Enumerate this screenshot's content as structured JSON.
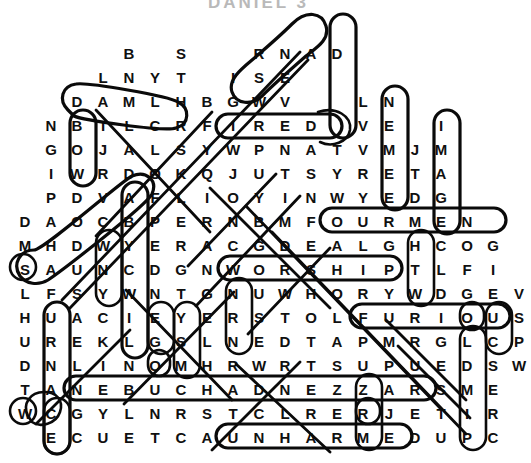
{
  "title": "DANIEL 3",
  "puzzle": {
    "kind": "word-search",
    "shape": "diamond",
    "cell_width": 26,
    "cell_height": 24,
    "origin_x": 12,
    "origin_y": 42,
    "rows": [
      {
        "index": 0,
        "start_col": 4,
        "letters": [
          "B",
          "",
          "S",
          "",
          "",
          "R",
          "N",
          "A",
          "D"
        ]
      },
      {
        "index": 1,
        "start_col": 3,
        "letters": [
          "L",
          "N",
          "Y",
          "T",
          "",
          "I",
          "S",
          "E"
        ]
      },
      {
        "index": 2,
        "start_col": 2,
        "letters": [
          "D",
          "A",
          "M",
          "L",
          "H",
          "B",
          "G",
          "W",
          "V",
          "",
          "",
          "L",
          "N"
        ]
      },
      {
        "index": 3,
        "start_col": 1,
        "letters": [
          "N",
          "B",
          "I",
          "L",
          "C",
          "R",
          "F",
          "I",
          "R",
          "E",
          "D",
          "",
          "V",
          "E",
          "",
          "I"
        ]
      },
      {
        "index": 4,
        "start_col": 1,
        "letters": [
          "G",
          "O",
          "J",
          "A",
          "L",
          "S",
          "Y",
          "W",
          "P",
          "N",
          "A",
          "T",
          "V",
          "M",
          "J",
          "M"
        ]
      },
      {
        "index": 5,
        "start_col": 1,
        "letters": [
          "I",
          "W",
          "R",
          "D",
          "O",
          "K",
          "Q",
          "J",
          "U",
          "T",
          "S",
          "Y",
          "R",
          "E",
          "T",
          "A"
        ]
      },
      {
        "index": 6,
        "start_col": 1,
        "letters": [
          "P",
          "D",
          "V",
          "A",
          "F",
          "L",
          "I",
          "O",
          "Y",
          "I",
          "N",
          "W",
          "Y",
          "E",
          "D",
          "G"
        ]
      },
      {
        "index": 7,
        "start_col": 0,
        "letters": [
          "D",
          "A",
          "O",
          "C",
          "B",
          "P",
          "E",
          "R",
          "N",
          "B",
          "M",
          "F",
          "O",
          "U",
          "R",
          "M",
          "E",
          "N"
        ]
      },
      {
        "index": 8,
        "start_col": 0,
        "letters": [
          "M",
          "H",
          "D",
          "W",
          "Y",
          "E",
          "R",
          "A",
          "C",
          "G",
          "D",
          "E",
          "A",
          "L",
          "G",
          "H",
          "C",
          "O",
          "G"
        ]
      },
      {
        "index": 9,
        "start_col": 0,
        "letters": [
          "S",
          "A",
          "U",
          "N",
          "C",
          "D",
          "G",
          "N",
          "W",
          "O",
          "R",
          "S",
          "H",
          "I",
          "P",
          "T",
          "L",
          "F",
          "I"
        ]
      },
      {
        "index": 10,
        "start_col": 0,
        "letters": [
          "L",
          "F",
          "S",
          "Y",
          "W",
          "N",
          "T",
          "G",
          "N",
          "U",
          "W",
          "H",
          "O",
          "R",
          "Y",
          "W",
          "D",
          "G",
          "E",
          "V"
        ]
      },
      {
        "index": 11,
        "start_col": 0,
        "letters": [
          "H",
          "U",
          "A",
          "C",
          "I",
          "E",
          "Y",
          "E",
          "R",
          "S",
          "T",
          "O",
          "L",
          "F",
          "U",
          "R",
          "I",
          "O",
          "U",
          "S"
        ]
      },
      {
        "index": 12,
        "start_col": 0,
        "letters": [
          "U",
          "R",
          "E",
          "K",
          "L",
          "G",
          "S",
          "L",
          "N",
          "E",
          "D",
          "T",
          "A",
          "P",
          "M",
          "R",
          "G",
          "L",
          "C",
          "P"
        ]
      },
      {
        "index": 13,
        "start_col": 0,
        "letters": [
          "D",
          "N",
          "L",
          "I",
          "N",
          "O",
          "M",
          "H",
          "R",
          "W",
          "R",
          "T",
          "S",
          "U",
          "P",
          "U",
          "E",
          "D",
          "S",
          "W"
        ]
      },
      {
        "index": 14,
        "start_col": 0,
        "letters": [
          "T",
          "A",
          "N",
          "E",
          "B",
          "U",
          "C",
          "H",
          "A",
          "D",
          "N",
          "E",
          "Z",
          "Z",
          "A",
          "R",
          "S",
          "M",
          "E"
        ]
      },
      {
        "index": 15,
        "start_col": 0,
        "letters": [
          "W",
          "C",
          "G",
          "Y",
          "L",
          "N",
          "R",
          "S",
          "T",
          "C",
          "L",
          "R",
          "E",
          "R",
          "J",
          "E",
          "T",
          "I",
          "R"
        ]
      },
      {
        "index": 16,
        "start_col": 1,
        "letters": [
          "E",
          "C",
          "U",
          "E",
          "T",
          "C",
          "A",
          "U",
          "N",
          "H",
          "A",
          "R",
          "M",
          "E",
          "D",
          "U",
          "P",
          "C"
        ]
      }
    ],
    "found_words": [
      {
        "word": "FIRED",
        "orientation": "horizontal",
        "row": 3,
        "col": 7
      },
      {
        "word": "FOUR MEN",
        "orientation": "horizontal",
        "row": 7,
        "col": 11
      },
      {
        "word": "WORSHIP",
        "orientation": "horizontal",
        "row": 9,
        "col": 8
      },
      {
        "word": "FURIOUS",
        "orientation": "horizontal",
        "row": 11,
        "col": 13
      },
      {
        "word": "NEBUCHADNEZZAR",
        "orientation": "horizontal",
        "row": 14,
        "col": 2
      },
      {
        "word": "UNHARMED",
        "orientation": "horizontal",
        "row": 16,
        "col": 8
      },
      {
        "word": "FURNACE",
        "orientation": "vertical",
        "row": 10,
        "col": 1
      },
      {
        "word": "ABEDNEGO",
        "orientation": "vertical",
        "row": 6,
        "col": 4
      },
      {
        "word": "IMAGE",
        "orientation": "vertical",
        "row": 3,
        "col": 16
      },
      {
        "word": "BOW",
        "orientation": "vertical",
        "row": 3,
        "col": 2
      },
      {
        "word": "DSEVE",
        "orientation": "vertical",
        "row": 0,
        "col": 12
      },
      {
        "word": "NEDG",
        "orientation": "vertical",
        "row": 2,
        "col": 14
      },
      {
        "word": "WNC",
        "orientation": "vertical",
        "row": 8,
        "col": 4
      },
      {
        "word": "LSN",
        "orientation": "vertical",
        "row": 10,
        "col": 8
      },
      {
        "word": "GOM",
        "orientation": "vertical",
        "row": 11,
        "col": 6
      },
      {
        "word": "HTL",
        "orientation": "vertical",
        "row": 8,
        "col": 16
      },
      {
        "word": "EUC",
        "orientation": "vertical",
        "row": 10,
        "col": 19
      },
      {
        "word": "CSERC",
        "orientation": "vertical",
        "row": 12,
        "col": 19
      },
      {
        "word": "SA",
        "orientation": "diagonal",
        "row": 9,
        "col": 0
      },
      {
        "word": "W",
        "orientation": "diagonal",
        "row": 15,
        "col": 0
      },
      {
        "word": "RER",
        "orientation": "vertical",
        "row": 14,
        "col": 12
      }
    ]
  }
}
